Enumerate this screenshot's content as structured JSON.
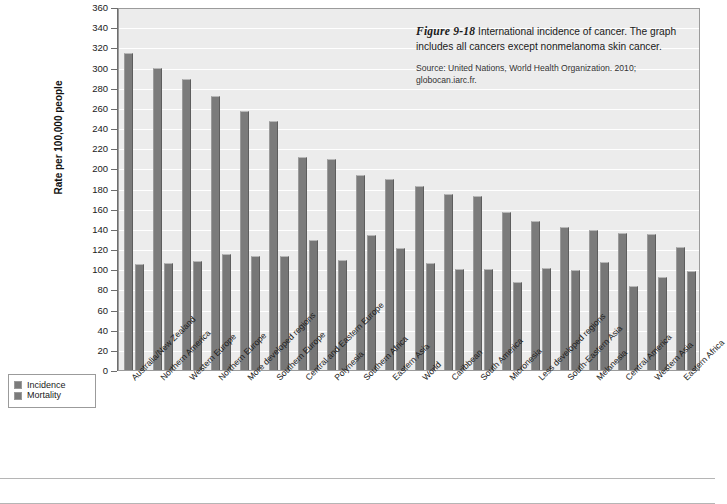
{
  "figure": {
    "fig_number": "Figure 9-18",
    "caption_text": " International incidence of cancer. The graph includes all cancers except nonmelanoma skin cancer.",
    "source": "Source: United Nations, World Health Organization. 2010; globocan.iarc.fr."
  },
  "legend": {
    "items": [
      {
        "label": "Incidence",
        "color": "#7b7b7b"
      },
      {
        "label": "Mortality",
        "color": "#777777"
      }
    ]
  },
  "chart_data": {
    "type": "bar",
    "title": "International incidence of cancer",
    "xlabel": "",
    "ylabel": "Rate per 100,000 people",
    "ylim": [
      0,
      360
    ],
    "ytick_step": 20,
    "yticks": [
      0,
      20,
      40,
      60,
      80,
      100,
      120,
      140,
      160,
      180,
      200,
      220,
      240,
      260,
      280,
      300,
      320,
      340,
      360
    ],
    "grid": true,
    "legend_position": "outside-bottom-left",
    "categories": [
      "Australia/New Zealand",
      "Northern America",
      "Western Europe",
      "Northern Europe",
      "More developed regions",
      "Southern Europe",
      "Central and Eastern Europe",
      "Polynesia",
      "Southern Africa",
      "Eastern Asia",
      "World",
      "Caribbean",
      "South America",
      "Micronesia",
      "Less developed regions",
      "South-Eastern Asia",
      "Melanesia",
      "Central America",
      "Western Asia",
      "Eastern Africa"
    ],
    "series": [
      {
        "name": "Incidence",
        "color": "#7b7b7b",
        "values": [
          314,
          300,
          289,
          272,
          257,
          247,
          211,
          209,
          193,
          189,
          182,
          175,
          173,
          157,
          148,
          142,
          139,
          136,
          135,
          122
        ]
      },
      {
        "name": "Mortality",
        "color": "#777777",
        "values": [
          105,
          106,
          108,
          115,
          113,
          113,
          129,
          109,
          134,
          121,
          106,
          100,
          100,
          87,
          101,
          99,
          107,
          83,
          92,
          98
        ]
      }
    ]
  }
}
